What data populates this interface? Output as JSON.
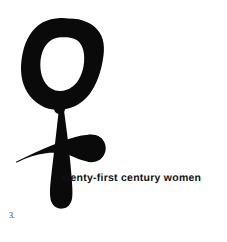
{
  "poster": {
    "width": 227,
    "height": 242,
    "background_color": "#ffffff",
    "ink_color": "#0a0a0a",
    "symbol_name": "venus-female-gender-symbol",
    "symbol_description": "hand-brushed black ink Venus (female) symbol: open ring above a vertical stem crossed by a tapering horizontal bar"
  },
  "tagline": {
    "full_text": "twenty-first century women",
    "hidden_lead": "t",
    "visible_text": "wenty-first century women",
    "color": "#111111"
  },
  "caption": {
    "figure_number": "3."
  }
}
